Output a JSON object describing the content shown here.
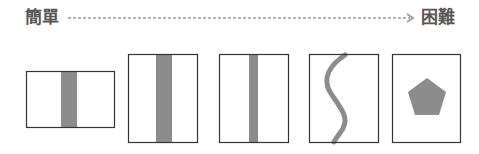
{
  "header": {
    "easy_label": "簡單",
    "hard_label": "困難",
    "arrow": "difficulty-scale"
  },
  "colors": {
    "text": "#555555",
    "frame": "#333333",
    "fill": "#8c8c8c",
    "dash": "#999999"
  },
  "panels": [
    {
      "id": 1,
      "shape": "short-wide-frame-with-vertical-stripe"
    },
    {
      "id": 2,
      "shape": "tall-frame-with-wide-vertical-stripe"
    },
    {
      "id": 3,
      "shape": "tall-frame-with-narrow-vertical-stripe"
    },
    {
      "id": 4,
      "shape": "tall-frame-with-s-curve"
    },
    {
      "id": 5,
      "shape": "tall-frame-with-pentagon"
    }
  ]
}
